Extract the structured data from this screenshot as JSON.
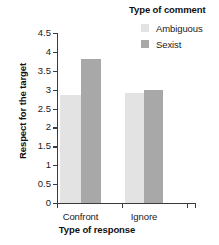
{
  "chart_data": {
    "type": "bar",
    "title": "",
    "xlabel": "Type of response",
    "ylabel": "Respect for the target",
    "categories": [
      "Confront",
      "Ignore"
    ],
    "series": [
      {
        "name": "Ambiguous",
        "color": "#e3e3e3",
        "values": [
          2.85,
          2.9
        ]
      },
      {
        "name": "Sexist",
        "color": "#a8a8a8",
        "values": [
          3.8,
          3.0
        ]
      }
    ],
    "ylim": [
      0,
      4.5
    ],
    "ytick_labels": [
      "0",
      "0.5",
      "1",
      "1.5",
      "2",
      "2.5",
      "3",
      "3.5",
      "4",
      "4.5"
    ],
    "ytick_values": [
      0,
      0.5,
      1,
      1.5,
      2,
      2.5,
      3,
      3.5,
      4,
      4.5
    ],
    "grid": false,
    "legend": {
      "title": "Type of comment",
      "position": "top-right",
      "entries": [
        "Ambiguous",
        "Sexist"
      ]
    }
  },
  "legend": {
    "title": "Type of comment",
    "items": [
      {
        "label": "Ambiguous",
        "color": "#e3e3e3"
      },
      {
        "label": "Sexist",
        "color": "#a8a8a8"
      }
    ]
  },
  "axes": {
    "x_title": "Type of response",
    "y_title": "Respect for the target",
    "x_categories": [
      "Confront",
      "Ignore"
    ],
    "y_ticks": [
      "4.5",
      "4",
      "3.5",
      "3",
      "2.5",
      "2",
      "1.5",
      "1",
      "0.5",
      "0"
    ]
  },
  "colors": {
    "ambiguous": "#e3e3e3",
    "sexist": "#a8a8a8",
    "axis": "#3b3b3b",
    "text": "#1a1a1a",
    "background": "#ffffff"
  }
}
